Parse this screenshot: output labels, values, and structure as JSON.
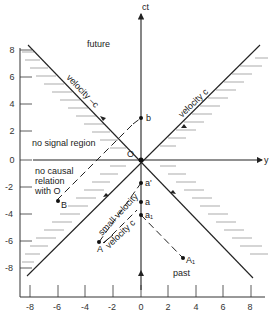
{
  "axes": {
    "vertical_label": "ct",
    "horizontal_label": "y",
    "x_ticks": [
      "-8",
      "-6",
      "-4",
      "-2",
      "0",
      "2",
      "4",
      "6",
      "8"
    ],
    "y_ticks": [
      "8",
      "6",
      "4",
      "2",
      "0",
      "-2",
      "-4",
      "-6",
      "-8"
    ]
  },
  "regions": {
    "future": "future",
    "past": "past",
    "no_signal": "no signal region",
    "no_causal_1": "no causal",
    "no_causal_2": "relation",
    "no_causal_3": "with O"
  },
  "lines": {
    "velocity_neg_c": "velocity  –c",
    "velocity_c": "velocity  c",
    "small_velocity": "small velocity",
    "velocity_c_lower": "velocity c"
  },
  "points": {
    "origin": "O",
    "b": "b",
    "B": "B",
    "a_prime": "a'",
    "a": "a",
    "a1": "a₁",
    "A": "A",
    "A1": "A₁"
  }
}
